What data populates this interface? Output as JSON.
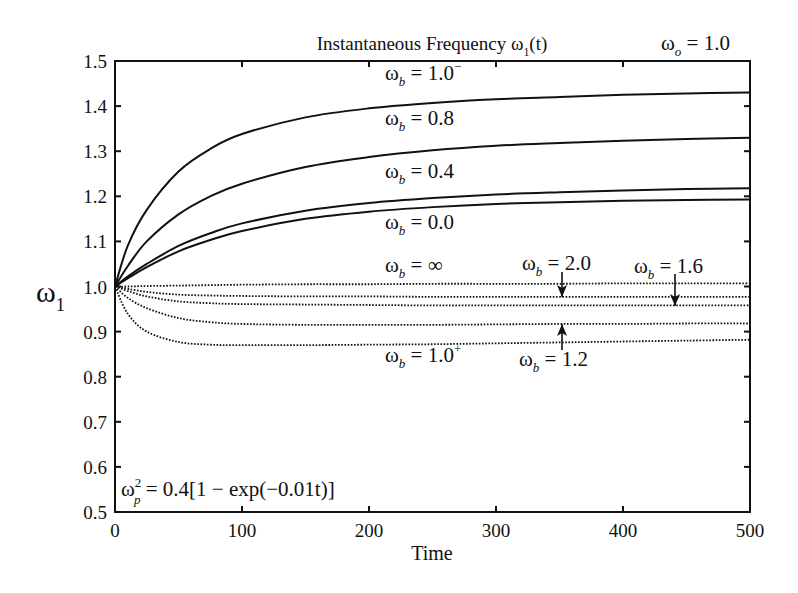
{
  "chart_data": {
    "type": "line",
    "title": "Instantaneous Frequency ω1(t)",
    "title_parts": {
      "main": "Instantaneous Frequency ω",
      "sub": "1",
      "tail": "(t)"
    },
    "corner_label": {
      "main": "ω",
      "sub": "o",
      "tail": " = 1.0"
    },
    "xlabel": "Time",
    "ylabel": {
      "main": "ω",
      "sub": "1"
    },
    "xlim": [
      0,
      500
    ],
    "ylim": [
      0.5,
      1.5
    ],
    "xticks": [
      0,
      100,
      200,
      300,
      400,
      500
    ],
    "yticks": [
      0.5,
      0.6,
      0.7,
      0.8,
      0.9,
      1.0,
      1.1,
      1.2,
      1.3,
      1.4,
      1.5
    ],
    "ytick_labels": [
      "0.5",
      "0.6",
      "0.7",
      "0.8",
      "0.9",
      "1.0",
      "1.1",
      "1.2",
      "1.3",
      "1.4",
      "1.5"
    ],
    "grid": false,
    "legend": "inline labels",
    "annotation": {
      "main": "ω",
      "sup": "2",
      "sub": "p",
      "tail": " = 0.4[1 − exp(−0.01t)]"
    },
    "x": [
      0,
      10,
      25,
      50,
      75,
      100,
      150,
      200,
      250,
      300,
      350,
      400,
      450,
      500
    ],
    "series": [
      {
        "name": "ωb = 1.0⁻",
        "style": "solid",
        "values": [
          1.0,
          1.09,
          1.17,
          1.255,
          1.305,
          1.338,
          1.375,
          1.395,
          1.407,
          1.415,
          1.42,
          1.425,
          1.428,
          1.43
        ]
      },
      {
        "name": "ωb = 0.8",
        "style": "solid",
        "values": [
          1.0,
          1.045,
          1.1,
          1.16,
          1.2,
          1.228,
          1.265,
          1.287,
          1.302,
          1.312,
          1.318,
          1.323,
          1.327,
          1.33
        ]
      },
      {
        "name": "ωb = 0.4",
        "style": "solid",
        "values": [
          1.0,
          1.022,
          1.05,
          1.09,
          1.118,
          1.14,
          1.168,
          1.185,
          1.196,
          1.204,
          1.209,
          1.213,
          1.216,
          1.218
        ]
      },
      {
        "name": "ωb = 0.0",
        "style": "solid",
        "values": [
          1.0,
          1.018,
          1.043,
          1.078,
          1.103,
          1.123,
          1.15,
          1.166,
          1.176,
          1.183,
          1.187,
          1.19,
          1.192,
          1.193
        ]
      },
      {
        "name": "ωb = ∞",
        "style": "dotted",
        "values": [
          1.0,
          1.0,
          1.001,
          1.002,
          1.003,
          1.004,
          1.005,
          1.005,
          1.006,
          1.006,
          1.006,
          1.007,
          1.007,
          1.007
        ]
      },
      {
        "name": "ωb = 2.0",
        "style": "dotted",
        "values": [
          1.0,
          0.995,
          0.988,
          0.982,
          0.98,
          0.979,
          0.978,
          0.978,
          0.977,
          0.977,
          0.977,
          0.977,
          0.977,
          0.977
        ]
      },
      {
        "name": "ωb = 1.6",
        "style": "dotted",
        "values": [
          1.0,
          0.99,
          0.978,
          0.967,
          0.963,
          0.961,
          0.96,
          0.959,
          0.958,
          0.958,
          0.958,
          0.958,
          0.958,
          0.958
        ]
      },
      {
        "name": "ωb = 1.2",
        "style": "dotted",
        "values": [
          1.0,
          0.975,
          0.952,
          0.93,
          0.921,
          0.917,
          0.915,
          0.915,
          0.915,
          0.916,
          0.917,
          0.917,
          0.918,
          0.918
        ]
      },
      {
        "name": "ωb = 1.0⁺",
        "style": "dotted",
        "values": [
          1.0,
          0.94,
          0.9,
          0.877,
          0.871,
          0.87,
          0.87,
          0.871,
          0.872,
          0.874,
          0.876,
          0.878,
          0.88,
          0.882
        ]
      }
    ],
    "curve_labels": [
      {
        "main": "ω",
        "sub": "b",
        "tail": " = 1.0",
        "sup": "−",
        "x": 385,
        "y": 80
      },
      {
        "main": "ω",
        "sub": "b",
        "tail": " = 0.8",
        "x": 385,
        "y": 125
      },
      {
        "main": "ω",
        "sub": "b",
        "tail": " = 0.4",
        "x": 385,
        "y": 178
      },
      {
        "main": "ω",
        "sub": "b",
        "tail": " = 0.0",
        "x": 385,
        "y": 229
      },
      {
        "main": "ω",
        "sub": "b",
        "tail": " = ∞",
        "x": 385,
        "y": 272
      },
      {
        "main": "ω",
        "sub": "b",
        "tail": " = 2.0",
        "x": 522,
        "y": 270
      },
      {
        "main": "ω",
        "sub": "b",
        "tail": " = 1.6",
        "x": 634,
        "y": 273
      },
      {
        "main": "ω",
        "sub": "b",
        "tail": " = 1.0",
        "sup": "+",
        "x": 385,
        "y": 362
      },
      {
        "main": "ω",
        "sub": "b",
        "tail": " = 1.2",
        "x": 519,
        "y": 366
      }
    ],
    "arrows": [
      {
        "label": "ωb = 2.0",
        "x": 562,
        "y1": 272,
        "y2": 297,
        "dir": "down"
      },
      {
        "label": "ωb = 1.6",
        "x": 675,
        "y1": 274,
        "y2": 306,
        "dir": "down"
      },
      {
        "label": "ωb = 1.2",
        "x": 562,
        "y1": 350,
        "y2": 324,
        "dir": "up"
      }
    ]
  }
}
